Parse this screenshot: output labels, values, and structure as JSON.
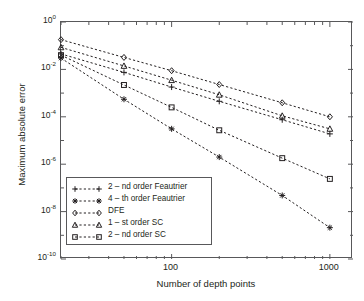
{
  "chart_data": {
    "type": "line",
    "title": "",
    "xlabel": "Number of depth points",
    "ylabel": "Maximum absolute error",
    "xscale": "log",
    "yscale": "log",
    "xlim": [
      20,
      1400
    ],
    "ylim": [
      1e-10,
      1
    ],
    "xticks": [
      100,
      1000
    ],
    "xtick_labels": [
      "100",
      "1000"
    ],
    "yticks": [
      1,
      0.01,
      0.0001,
      1e-06,
      1e-08,
      1e-10
    ],
    "ytick_labels": [
      "10",
      "10",
      "10",
      "10",
      "10",
      "10"
    ],
    "ytick_exponents": [
      "0",
      "-2",
      "-4",
      "-6",
      "-8",
      "-10"
    ],
    "grid": false,
    "legend_position": "lower left",
    "x": [
      20,
      50,
      100,
      200,
      500,
      1000
    ],
    "series": [
      {
        "name": "2 – nd order Feautrier",
        "marker": "plus",
        "linestyle": "dashed",
        "values": [
          0.045,
          0.0075,
          0.0018,
          0.00045,
          7.5e-05,
          1.9e-05
        ]
      },
      {
        "name": "4 – th order Feautrier",
        "marker": "asterisk",
        "linestyle": "dashed",
        "values": [
          0.03,
          0.00055,
          3.1e-05,
          2e-06,
          4.8e-08,
          2.1e-09
        ]
      },
      {
        "name": "DFE",
        "marker": "diamond",
        "linestyle": "dashed",
        "values": [
          0.18,
          0.032,
          0.0088,
          0.0023,
          0.00039,
          0.0001
        ]
      },
      {
        "name": "1 – st order SC",
        "marker": "triangle",
        "linestyle": "dashed",
        "values": [
          0.085,
          0.014,
          0.0035,
          0.00085,
          0.00011,
          3.1e-05
        ]
      },
      {
        "name": "2 – nd order SC",
        "marker": "square",
        "linestyle": "dashed",
        "values": [
          0.04,
          0.0022,
          0.00025,
          2.7e-05,
          1.8e-06,
          2.4e-07
        ]
      }
    ]
  },
  "legend": {
    "items": [
      {
        "label": "2 – nd order Feautrier",
        "marker": "plus"
      },
      {
        "label": "4 – th order Feautrier",
        "marker": "asterisk"
      },
      {
        "label": "DFE",
        "marker": "diamond"
      },
      {
        "label": "1 – st order SC",
        "marker": "triangle"
      },
      {
        "label": "2 – nd order SC",
        "marker": "square"
      }
    ]
  },
  "axes": {
    "x_title": "Number of depth points",
    "y_title": "Maximum absolute error",
    "x_tick_labels": [
      "100",
      "1000"
    ],
    "y_tick_mantissa": "10",
    "y_tick_exponents": [
      "0",
      "-2",
      "-4",
      "-6",
      "-8",
      "-10"
    ]
  },
  "colors": {
    "axis": "#58585a",
    "ink": "#231f20",
    "background": "#ffffff"
  }
}
